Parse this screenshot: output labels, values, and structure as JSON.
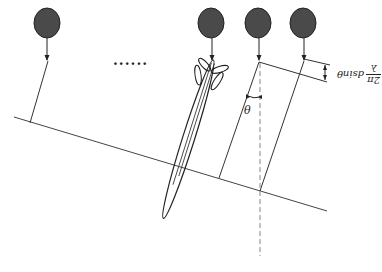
{
  "diagram": {
    "title": "",
    "ellipsis": "......",
    "angle_label": "θ",
    "formula": {
      "numerator": "2π",
      "denominator": "λ",
      "expression": "dsinθ",
      "rendered_rotation_deg": 180
    },
    "elements": [
      {
        "id": "element-1",
        "center": [
          47,
          23
        ]
      },
      {
        "id": "element-2",
        "center": [
          210,
          23
        ]
      },
      {
        "id": "element-3",
        "center": [
          257,
          23
        ]
      },
      {
        "id": "element-4",
        "center": [
          302,
          23
        ]
      }
    ],
    "colors": {
      "element_fill": "#4a4a4a",
      "stroke": "#222222",
      "dashed": "#888888",
      "background": "#ffffff"
    }
  }
}
